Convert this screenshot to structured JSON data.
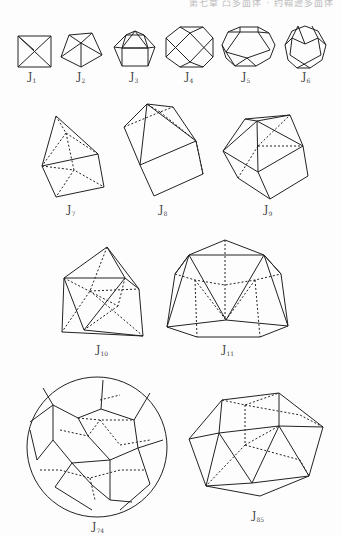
{
  "header": {
    "text": "第七章 凸多面体 · 约翰逊多面体"
  },
  "figures": [
    {
      "id": "J1",
      "label": "J",
      "sub": "1"
    },
    {
      "id": "J2",
      "label": "J",
      "sub": "2"
    },
    {
      "id": "J3",
      "label": "J",
      "sub": "3"
    },
    {
      "id": "J4",
      "label": "J",
      "sub": "4"
    },
    {
      "id": "J5",
      "label": "J",
      "sub": "5"
    },
    {
      "id": "J6",
      "label": "J",
      "sub": "6"
    },
    {
      "id": "J7",
      "label": "J",
      "sub": "7"
    },
    {
      "id": "J8",
      "label": "J",
      "sub": "8"
    },
    {
      "id": "J9",
      "label": "J",
      "sub": "9"
    },
    {
      "id": "J10",
      "label": "J",
      "sub": "10"
    },
    {
      "id": "J11",
      "label": "J",
      "sub": "11"
    },
    {
      "id": "J74",
      "label": "J",
      "sub": "74"
    },
    {
      "id": "J85",
      "label": "J",
      "sub": "85"
    }
  ]
}
